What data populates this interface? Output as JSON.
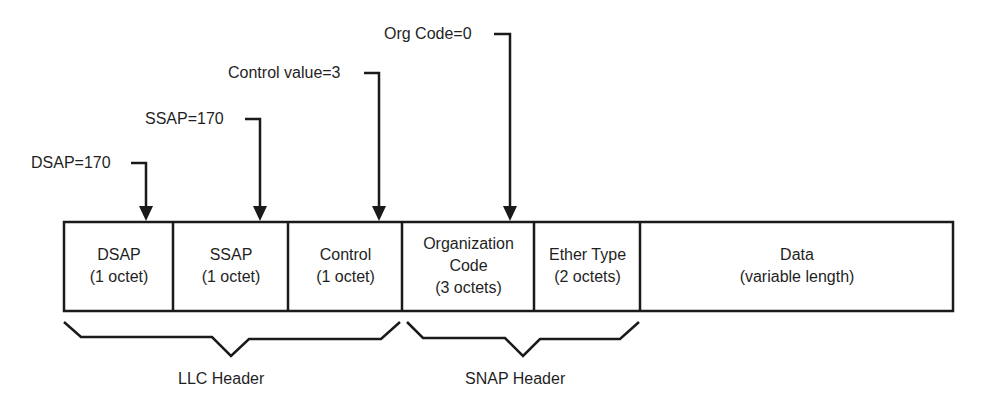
{
  "diagram": {
    "type": "frame-format",
    "colors": {
      "stroke": "#1a1a1a",
      "text": "#1f1f1f",
      "background": "#ffffff"
    },
    "pointers": [
      {
        "label": "DSAP=170",
        "target": "DSAP"
      },
      {
        "label": "SSAP=170",
        "target": "SSAP"
      },
      {
        "label": "Control value=3",
        "target": "Control"
      },
      {
        "label": "Org Code=0",
        "target": "Organization Code"
      }
    ],
    "fields": [
      {
        "name": "DSAP",
        "size": "(1 octet)"
      },
      {
        "name": "SSAP",
        "size": "(1 octet)"
      },
      {
        "name": "Control",
        "size": "(1 octet)"
      },
      {
        "name": "Organization",
        "name2": "Code",
        "size": "(3 octets)"
      },
      {
        "name": "Ether Type",
        "size": "(2 octets)"
      },
      {
        "name": "Data",
        "size": "(variable length)"
      }
    ],
    "groups": [
      {
        "label": "LLC Header",
        "spans": [
          "DSAP",
          "SSAP",
          "Control"
        ]
      },
      {
        "label": "SNAP Header",
        "spans": [
          "Organization Code",
          "Ether Type"
        ]
      }
    ]
  }
}
